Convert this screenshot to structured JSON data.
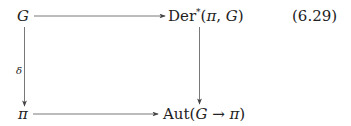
{
  "diagram": {
    "equation_number": "(6.29)",
    "nodes": {
      "top_left": "G",
      "top_right_prefix": "Der",
      "top_right_sup": "*",
      "top_right_args_open": "(",
      "top_right_arg1": "π",
      "top_right_sep": ", ",
      "top_right_arg2": "G",
      "top_right_args_close": ")",
      "bottom_left": "π",
      "bottom_right_prefix": "Aut",
      "bottom_right_open": "(",
      "bottom_right_arg1": "G",
      "bottom_right_arrow": " → ",
      "bottom_right_arg2": "π",
      "bottom_right_close": ")"
    },
    "arrows": [
      {
        "from": "G",
        "to": "Der*(π, G)",
        "label": ""
      },
      {
        "from": "G",
        "to": "π",
        "label": "δ"
      },
      {
        "from": "Der*(π, G)",
        "to": "Aut(G → π)",
        "label": ""
      },
      {
        "from": "π",
        "to": "Aut(G → π)",
        "label": ""
      }
    ],
    "left_arrow_label": "δ"
  }
}
